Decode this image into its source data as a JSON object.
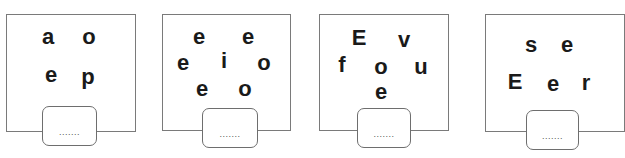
{
  "puzzles": [
    {
      "letters": [
        "a",
        "o",
        "e",
        "p"
      ],
      "answer": {
        "value": "",
        "placeholder": "......."
      }
    },
    {
      "letters": [
        "e",
        "e",
        "e",
        "i",
        "o",
        "e",
        "o"
      ],
      "answer": {
        "value": "",
        "placeholder": "......."
      }
    },
    {
      "letters": [
        "E",
        "v",
        "f",
        "o",
        "u",
        "e"
      ],
      "answer": {
        "value": "",
        "placeholder": "......."
      }
    },
    {
      "letters": [
        "s",
        "e",
        "E",
        "e",
        "r"
      ],
      "answer": {
        "value": "",
        "placeholder": "......."
      }
    }
  ],
  "colors": {
    "border": "#7a7a7a",
    "letter": "#1a1a1a",
    "background": "#ffffff"
  }
}
